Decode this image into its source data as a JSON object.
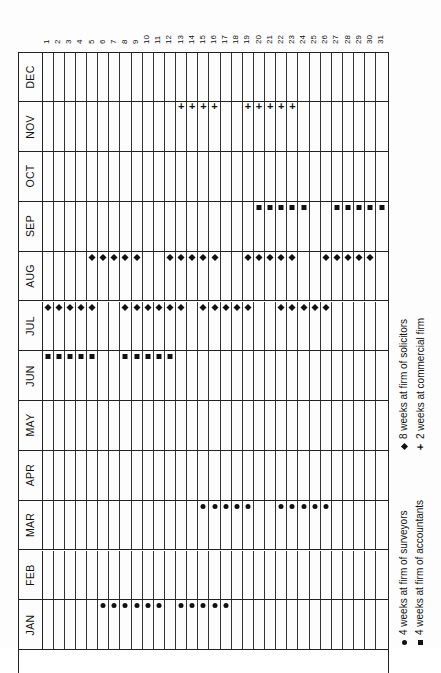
{
  "orientation": "rotated-90-ccw",
  "days": [
    "1",
    "2",
    "3",
    "4",
    "5",
    "6",
    "7",
    "8",
    "9",
    "10",
    "11",
    "12",
    "13",
    "14",
    "15",
    "16",
    "17",
    "18",
    "19",
    "20",
    "21",
    "22",
    "23",
    "24",
    "25",
    "26",
    "27",
    "28",
    "29",
    "30",
    "31"
  ],
  "months": [
    {
      "label": "DEC",
      "marks": []
    },
    {
      "label": "NOV",
      "marks": [
        {
          "type": "plus",
          "days": [
            13,
            14,
            15,
            16,
            19,
            20,
            21,
            22,
            23
          ]
        }
      ]
    },
    {
      "label": "OCT",
      "marks": []
    },
    {
      "label": "SEP",
      "marks": [
        {
          "type": "square",
          "days": [
            20,
            21,
            22,
            23,
            24,
            27,
            28,
            29,
            30,
            31
          ]
        }
      ]
    },
    {
      "label": "AUG",
      "marks": [
        {
          "type": "diamond",
          "days": [
            5,
            6,
            7,
            8,
            9,
            12,
            13,
            14,
            15,
            16,
            19,
            20,
            21,
            22,
            23,
            26,
            27,
            28,
            29,
            30
          ]
        }
      ]
    },
    {
      "label": "JUL",
      "marks": [
        {
          "type": "diamond",
          "days": [
            1,
            2,
            3,
            4,
            5,
            8,
            9,
            10,
            11,
            12,
            13,
            15,
            16,
            17,
            18,
            19,
            22,
            23,
            24,
            25,
            26
          ]
        }
      ]
    },
    {
      "label": "JUN",
      "marks": [
        {
          "type": "square",
          "days": [
            1,
            2,
            3,
            4,
            5,
            8,
            9,
            10,
            11,
            12
          ]
        }
      ]
    },
    {
      "label": "MAY",
      "marks": []
    },
    {
      "label": "APR",
      "marks": []
    },
    {
      "label": "MAR",
      "marks": [
        {
          "type": "dot",
          "days": [
            15,
            16,
            17,
            18,
            19,
            22,
            23,
            24,
            25,
            26
          ]
        }
      ]
    },
    {
      "label": "FEB",
      "marks": []
    },
    {
      "label": "JAN",
      "marks": [
        {
          "type": "dot",
          "days": [
            6,
            7,
            8,
            9,
            10,
            11,
            13,
            14,
            15,
            16,
            17
          ]
        }
      ]
    }
  ],
  "legend": [
    {
      "symbol": "dot",
      "glyph": "●",
      "text": "4 weeks at firm of surveyors"
    },
    {
      "symbol": "square",
      "glyph": "■",
      "text": "4 weeks at firm of accountants"
    },
    {
      "symbol": "diamond",
      "glyph": "◆",
      "text": "8 weeks at firm of solicitors"
    },
    {
      "symbol": "plus",
      "glyph": "+",
      "text": "2 weeks at commercial firm"
    }
  ],
  "colors": {
    "ink": "#111111",
    "paper": "#fdfdfd",
    "gridline": "#222222"
  }
}
